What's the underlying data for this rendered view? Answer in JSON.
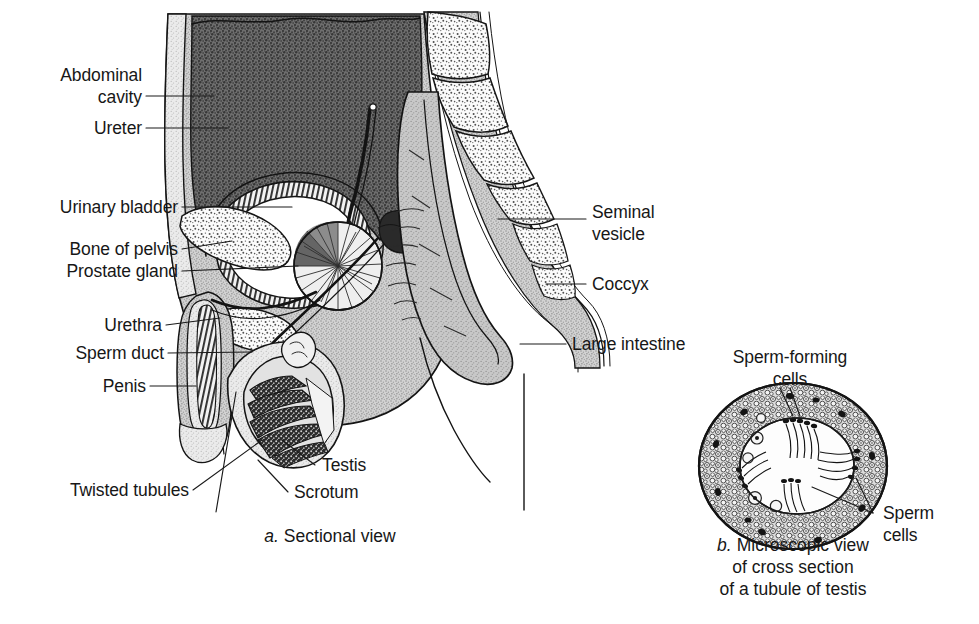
{
  "figure": {
    "background_color": "#ffffff",
    "ink_color": "#141414",
    "text_color": "#171717"
  },
  "panel_a": {
    "caption_prefix": "a.",
    "caption_text": "Sectional view",
    "labels": [
      {
        "id": "abdominal-cavity",
        "line1": "Abdominal",
        "line2": "cavity"
      },
      {
        "id": "ureter",
        "text": "Ureter"
      },
      {
        "id": "urinary-bladder",
        "text": "Urinary bladder"
      },
      {
        "id": "bone-of-pelvis",
        "text": "Bone of pelvis"
      },
      {
        "id": "prostate-gland",
        "text": "Prostate gland"
      },
      {
        "id": "urethra",
        "text": "Urethra"
      },
      {
        "id": "sperm-duct",
        "text": "Sperm duct"
      },
      {
        "id": "penis",
        "text": "Penis"
      },
      {
        "id": "twisted-tubules",
        "text": "Twisted tubules"
      },
      {
        "id": "testis",
        "text": "Testis"
      },
      {
        "id": "scrotum",
        "text": "Scrotum"
      },
      {
        "id": "seminal-vesicle",
        "line1": "Seminal",
        "line2": "vesicle"
      },
      {
        "id": "coccyx",
        "text": "Coccyx"
      },
      {
        "id": "large-intestine",
        "text": "Large intestine"
      }
    ]
  },
  "panel_b": {
    "caption_prefix": "b.",
    "caption_line1": "Microscopic view",
    "caption_line2": "of cross section",
    "caption_line3": "of a tubule of testis",
    "labels": [
      {
        "id": "sperm-forming-cells",
        "line1": "Sperm-forming",
        "line2": "cells"
      },
      {
        "id": "sperm-cells",
        "line1": "Sperm",
        "line2": "cells"
      }
    ]
  }
}
